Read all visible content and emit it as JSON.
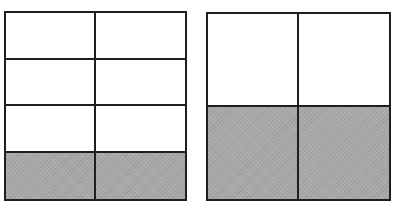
{
  "figures": [
    {
      "id": "left",
      "description": "Rectangle divided into 4 rows and 2 columns; bottom row shaded",
      "rows": 4,
      "cols": 2,
      "shaded_rows": [
        3
      ],
      "shaded_cells": 2,
      "total_cells": 8,
      "fraction_shaded": "2/8"
    },
    {
      "id": "right",
      "description": "Square divided into 2 rows and 2 columns; bottom row shaded",
      "rows": 2,
      "cols": 2,
      "shaded_rows": [
        1
      ],
      "shaded_cells": 2,
      "total_cells": 4,
      "fraction_shaded": "2/4"
    }
  ],
  "colors": {
    "line": "#1e1e1e",
    "shade": "#a8a8a8",
    "background": "#ffffff"
  }
}
